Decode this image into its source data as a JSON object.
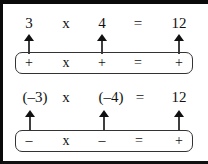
{
  "rows": [
    {
      "equation": {
        "a": "3",
        "op": "x",
        "b": "4",
        "eq": "=",
        "result": "12"
      },
      "signs": {
        "a": "+",
        "op": "x",
        "b": "+",
        "eq": "=",
        "result": "+"
      }
    },
    {
      "equation": {
        "a": "(–3)",
        "op": "x",
        "b": "(–4)",
        "eq": "=",
        "result": "12"
      },
      "signs": {
        "a": "–",
        "op": "x",
        "b": "–",
        "eq": "=",
        "result": "+"
      }
    }
  ],
  "icons": {
    "arrow": "arrow-up-icon"
  },
  "colors": {
    "border": "#0a0a0a",
    "text": "#111111",
    "background": "#ffffff"
  }
}
